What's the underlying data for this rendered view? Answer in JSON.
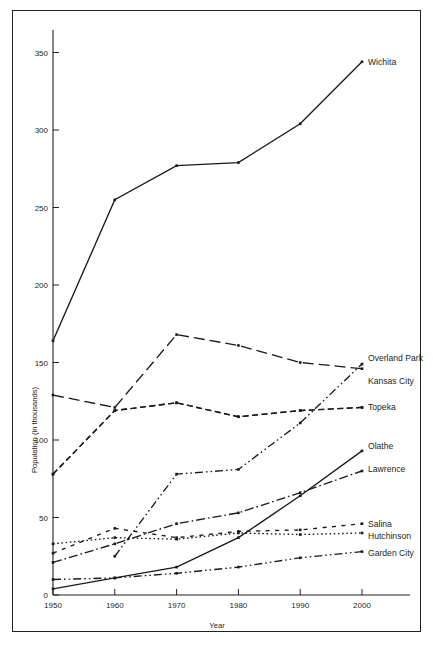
{
  "chart_data": {
    "type": "line",
    "title": "",
    "xlabel": "Year",
    "ylabel": "Population (in thousands)",
    "x": [
      1950,
      1960,
      1970,
      1980,
      1990,
      2000
    ],
    "xticklabels": [
      "1950",
      "1960",
      "1970",
      "1980",
      "1990",
      "2000"
    ],
    "yticklabels": [
      "0",
      "50",
      "100",
      "150",
      "200",
      "250",
      "300",
      "350"
    ],
    "yticks": [
      0,
      50,
      100,
      150,
      200,
      250,
      300,
      350
    ],
    "xlim": [
      1950,
      2000
    ],
    "ylim": [
      0,
      365
    ],
    "grid": false,
    "legend_position": "right-inline-labels",
    "series": [
      {
        "name": "Wichita",
        "label": "Wichita",
        "dash": "solid",
        "values": [
          164,
          255,
          277,
          279,
          304,
          344
        ],
        "label_y": 344
      },
      {
        "name": "Kansas City",
        "label": "Kansas City",
        "dash": "long-dash",
        "values": [
          129,
          121,
          168,
          161,
          150,
          146
        ],
        "label_y": 138
      },
      {
        "name": "Overland Park",
        "label": "Overland Park",
        "dash": "medium-dash",
        "values": [
          78,
          119,
          124,
          115,
          119,
          121
        ],
        "label_y": 153
      },
      {
        "name": "Topeka",
        "label": "Topeka",
        "dash": "medium-dash",
        "values": [
          78,
          119,
          124,
          115,
          119,
          121
        ],
        "label_y": 121
      },
      {
        "name": "Olathe",
        "label": "Olathe",
        "dash": "solid",
        "values": [
          4,
          11,
          18,
          37,
          64,
          93
        ],
        "label_y": 96
      },
      {
        "name": "Lawrence",
        "label": "Lawrence",
        "dash": "dash-dot",
        "values": [
          21,
          33,
          46,
          53,
          66,
          80
        ],
        "label_y": 81
      },
      {
        "name": "Salina",
        "label": "Salina",
        "dash": "sparse-dash",
        "values": [
          27,
          43,
          37,
          41,
          42,
          46
        ],
        "label_y": 46
      },
      {
        "name": "Hutchinson",
        "label": "Hutchinson",
        "dash": "dotted",
        "values": [
          33,
          37,
          36,
          40,
          39,
          40
        ],
        "label_y": 38
      },
      {
        "name": "Garden City",
        "label": "Garden City",
        "dash": "dash-dot-dot",
        "values": [
          10,
          11,
          14,
          18,
          24,
          28
        ],
        "label_y": 27
      },
      {
        "name": "Overland Park ascending",
        "label": "",
        "dash": "dash-dot-dot",
        "values": [
          null,
          25,
          78,
          81,
          111,
          149
        ],
        "label_y": null
      }
    ]
  },
  "axis": {
    "y_title": "Population (in thousands)",
    "x_title": "Year"
  }
}
